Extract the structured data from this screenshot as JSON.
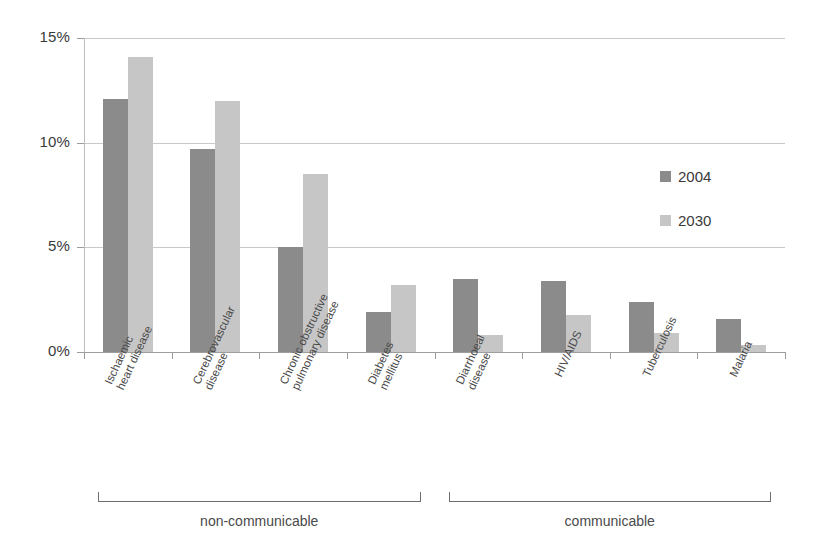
{
  "chart_data": {
    "type": "bar",
    "title": "",
    "xlabel": "",
    "ylabel": "",
    "ylim": [
      0,
      15
    ],
    "ytick_labels": [
      "0%",
      "5%",
      "10%",
      "15%"
    ],
    "ytick_values": [
      0,
      5,
      10,
      15
    ],
    "grid": true,
    "legend_position": "right",
    "categories": [
      "Ischaemic heart disease",
      "Cerebrovascular disease",
      "Chronic obstructive pulmonary disease",
      "Diabetes mellitus",
      "Diarrhoeal disease",
      "HIV/AIDS",
      "Tuberculosis",
      "Malaria"
    ],
    "category_lines": [
      [
        "Ischaemic",
        "heart disease"
      ],
      [
        "Cerebrovascular",
        "disease"
      ],
      [
        "Chronic obstructive",
        "pulmonary disease"
      ],
      [
        "Diabetes",
        "mellitus"
      ],
      [
        "Diarrhoeal",
        "disease"
      ],
      [
        "HIV/AIDS"
      ],
      [
        "Tuberculosis"
      ],
      [
        "Malaria"
      ]
    ],
    "series": [
      {
        "name": "2004",
        "color": "#8b8b8b",
        "values": [
          12.1,
          9.7,
          5.0,
          1.9,
          3.5,
          3.4,
          2.4,
          1.6
        ]
      },
      {
        "name": "2030",
        "color": "#c6c6c6",
        "values": [
          14.1,
          12.0,
          8.5,
          3.2,
          0.8,
          1.75,
          0.9,
          0.35
        ]
      }
    ],
    "groupings": [
      {
        "label": "non-communicable",
        "categories": [
          0,
          1,
          2,
          3
        ]
      },
      {
        "label": "communicable",
        "categories": [
          4,
          5,
          6,
          7
        ]
      }
    ]
  },
  "legend": {
    "items": [
      {
        "label": "2004",
        "color": "#8b8b8b"
      },
      {
        "label": "2030",
        "color": "#c6c6c6"
      }
    ]
  },
  "colors": {
    "series_2004": "#8b8b8b",
    "series_2030": "#c6c6c6",
    "gridline": "#c9c9c9",
    "axis": "#9d9d9d",
    "text": "#3f3f3f",
    "bracket": "#6e6e6e"
  }
}
